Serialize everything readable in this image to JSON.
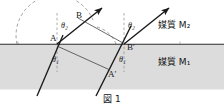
{
  "figure": {
    "caption": "図 1",
    "canvas": {
      "width": 224,
      "height": 110
    },
    "colors": {
      "ink": "#1a1a1a",
      "medium1_fill": "#dcdcdc",
      "interface_line": "#2a2a2a",
      "dashed": "#6e6e6e",
      "background": "#ffffff"
    },
    "media": {
      "upper": {
        "label": "媒質 M₂",
        "name": "媒質",
        "symbol": "M",
        "index": "2"
      },
      "lower": {
        "label": "媒質 M₁",
        "name": "媒質",
        "symbol": "M",
        "index": "1"
      }
    },
    "points": [
      {
        "id": "A",
        "label": "A",
        "x": 54,
        "y": 38
      },
      {
        "id": "B",
        "label": "B",
        "x": 79,
        "y": 15
      },
      {
        "id": "B_prime",
        "label": "B′",
        "x": 122,
        "y": 47
      },
      {
        "id": "A_prime",
        "label": "A′",
        "x": 110,
        "y": 73
      }
    ],
    "angles": [
      {
        "id": "theta2-left",
        "label": "θ₂",
        "symbol": "θ",
        "index": "2",
        "x": 64,
        "y": 24,
        "at_point": "A",
        "medium": "M₂"
      },
      {
        "id": "theta2-right",
        "label": "θ₂",
        "symbol": "θ",
        "index": "2",
        "x": 126,
        "y": 24,
        "at_point": "B′",
        "medium": "M₂"
      },
      {
        "id": "theta1-left",
        "label": "θ₁",
        "symbol": "θ",
        "index": "1",
        "x": 55,
        "y": 58,
        "at_point": "A",
        "medium": "M₁"
      },
      {
        "id": "theta1-right",
        "label": "θ₁",
        "symbol": "θ",
        "index": "1",
        "x": 118,
        "y": 59,
        "at_point": "B′",
        "medium": "M₁"
      }
    ],
    "interface": {
      "y": 44,
      "x_start": 0,
      "x_end": 224
    },
    "rays": [
      {
        "id": "incident-ray-1",
        "from": [
          38,
          96
        ],
        "to": [
          66,
          30
        ],
        "kind": "incident",
        "medium": "M₁",
        "arrow": true
      },
      {
        "id": "incident-ray-2",
        "from": [
          97,
          96
        ],
        "to": [
          134,
          22
        ],
        "kind": "incident",
        "medium": "M₁",
        "arrow": true
      },
      {
        "id": "refracted-ray-1",
        "from": [
          57,
          44
        ],
        "to": [
          104,
          6
        ],
        "kind": "refracted",
        "medium": "M₂",
        "arrow": true
      },
      {
        "id": "refracted-ray-2",
        "from": [
          124,
          44
        ],
        "to": [
          170,
          6
        ],
        "kind": "refracted",
        "medium": "M₂",
        "arrow": true
      },
      {
        "id": "wavefront-upper",
        "from": [
          79,
          17
        ],
        "to": [
          122,
          43
        ],
        "kind": "wavefront",
        "medium": "M₂",
        "arrow": false
      },
      {
        "id": "wavefront-lower",
        "from": [
          57,
          46
        ],
        "to": [
          110,
          71
        ],
        "kind": "wavefront",
        "medium": "M₁",
        "arrow": false
      }
    ],
    "dashed_elements": [
      {
        "id": "normal-at-A",
        "kind": "normal-line",
        "x": 57,
        "y_top": 14,
        "y_bottom": 72
      },
      {
        "id": "normal-at-B-prime",
        "kind": "normal-line",
        "x": 124,
        "y_top": 14,
        "y_bottom": 72
      },
      {
        "id": "big-arc",
        "kind": "arc",
        "center": [
          57,
          44
        ],
        "radius": 40,
        "note": "半円の破線弧"
      },
      {
        "id": "small-arc",
        "kind": "arc",
        "center": [
          122,
          44
        ],
        "radius": 28,
        "note": "小さい破線弧"
      }
    ]
  }
}
